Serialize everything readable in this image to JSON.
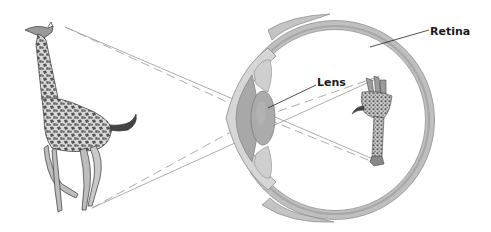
{
  "diagram": {
    "labels": {
      "lens": "Lens",
      "retina": "Retina"
    },
    "objects": {
      "object": "giraffe (upright)",
      "image": "giraffe (inverted on retina)"
    },
    "colors": {
      "background": "#ffffff",
      "eye_wall": "#c9c9c9",
      "eye_wall_dark": "#9a9a9a",
      "lens_fill": "#a9a9a9",
      "ray_line": "#9b9b9b",
      "leader_line": "#222222",
      "label_text": "#1a1a1a"
    }
  }
}
